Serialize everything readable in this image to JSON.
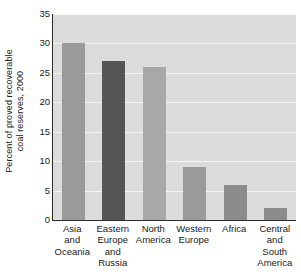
{
  "chart_data": {
    "type": "bar",
    "title": "",
    "xlabel": "",
    "ylabel": "Percent of proved recoverable coal reserves, 2000",
    "ylabel_lines": [
      "Percent of proved recoverable",
      "coal reserves, 2000"
    ],
    "categories": [
      "Asia and Oceania",
      "Eastern Europe and Russia",
      "North America",
      "Western Europe",
      "Africa",
      "Central and South America"
    ],
    "category_lines": [
      [
        "Asia",
        "and",
        "Oceania"
      ],
      [
        "Eastern",
        "Europe",
        "and",
        "Russia"
      ],
      [
        "North",
        "America"
      ],
      [
        "Western",
        "Europe"
      ],
      [
        "Africa"
      ],
      [
        "Central",
        "and",
        "South",
        "America"
      ]
    ],
    "values": [
      30,
      27,
      26,
      9,
      6,
      2
    ],
    "bar_colors": [
      "#9a9a9a",
      "#555555",
      "#a8a8a8",
      "#9a9a9a",
      "#8c8c8c",
      "#8c8c8c"
    ],
    "ylim": [
      0,
      35
    ],
    "yticks": [
      0,
      5,
      10,
      15,
      20,
      25,
      30,
      35
    ],
    "ytick_labels": [
      "0",
      "5",
      "10",
      "15",
      "20",
      "25",
      "30",
      "35"
    ],
    "grid": true,
    "grid_color": "#f4f4f4",
    "plot_background": "#dcdcdc",
    "axis_color": "#2b2b2b",
    "legend": null
  }
}
